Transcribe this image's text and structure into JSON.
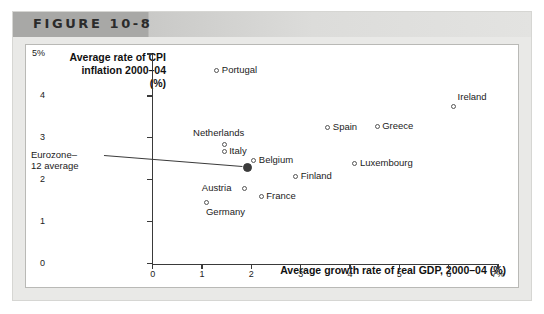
{
  "figure": {
    "number_label": "FIGURE 10-8"
  },
  "chart_data": {
    "type": "scatter",
    "title": "FIGURE 10-8",
    "xlabel": "Average growth rate of real GDP, 2000–04 (%)",
    "ylabel": "Average rate of CPI inflation 2000–04 (%)",
    "ylabel_lines": [
      "Average rate of CPI",
      "inflation 2000–04",
      "(%)"
    ],
    "xlim": [
      0,
      7
    ],
    "ylim": [
      0,
      5
    ],
    "grid": false,
    "legend": "none",
    "xticks": [
      "0",
      "1",
      "2",
      "3",
      "4",
      "5",
      "6",
      "7%"
    ],
    "xtick_values": [
      0,
      1,
      2,
      3,
      4,
      5,
      6,
      7
    ],
    "yticks": [
      "0",
      "1",
      "2",
      "3",
      "4",
      "5%"
    ],
    "ytick_values": [
      0,
      1,
      2,
      3,
      4,
      5
    ],
    "points": [
      {
        "name": "Portugal",
        "x": 1.3,
        "y": 4.6,
        "label_pos": "right"
      },
      {
        "name": "Ireland",
        "x": 6.1,
        "y": 3.75,
        "label_pos": "above-right"
      },
      {
        "name": "Spain",
        "x": 3.55,
        "y": 3.25,
        "label_pos": "right"
      },
      {
        "name": "Greece",
        "x": 4.55,
        "y": 3.27,
        "label_pos": "right"
      },
      {
        "name": "Netherlands",
        "x": 1.45,
        "y": 2.85,
        "label_pos": "above"
      },
      {
        "name": "Italy",
        "x": 1.45,
        "y": 2.68,
        "label_pos": "right"
      },
      {
        "name": "Belgium",
        "x": 2.05,
        "y": 2.46,
        "label_pos": "right"
      },
      {
        "name": "Luxembourg",
        "x": 4.1,
        "y": 2.38,
        "label_pos": "right"
      },
      {
        "name": "Finland",
        "x": 2.9,
        "y": 2.07,
        "label_pos": "right"
      },
      {
        "name": "Austria",
        "x": 1.87,
        "y": 1.78,
        "label_pos": "left"
      },
      {
        "name": "France",
        "x": 2.2,
        "y": 1.59,
        "label_pos": "right"
      },
      {
        "name": "Germany",
        "x": 1.1,
        "y": 1.45,
        "label_pos": "below-right"
      }
    ],
    "highlight_point": {
      "name": "Eurozone–12 average",
      "label_lines": [
        "Eurozone–",
        "12 average"
      ],
      "x": 1.92,
      "y": 2.29,
      "style": "filled"
    },
    "annotations": [
      {
        "text": "Eurozone–12 average",
        "target": "highlight_point",
        "leader_line": true
      }
    ]
  }
}
